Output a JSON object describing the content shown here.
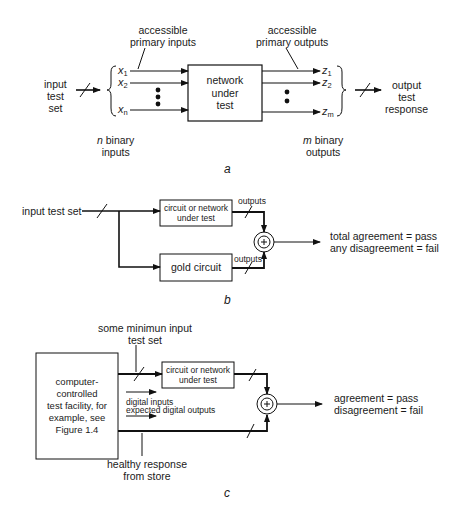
{
  "diagram_a": {
    "caption": "a",
    "input_label": [
      "input",
      "test",
      "set"
    ],
    "primary_inputs_label": [
      "accessible",
      "primary inputs"
    ],
    "primary_outputs_label": [
      "accessible",
      "primary outputs"
    ],
    "inputs": [
      {
        "name": "x",
        "sub": "1"
      },
      {
        "name": "x",
        "sub": "2"
      },
      {
        "name": "x",
        "sub": "n"
      }
    ],
    "outputs": [
      {
        "name": "z",
        "sub": "1"
      },
      {
        "name": "z",
        "sub": "2"
      },
      {
        "name": "z",
        "sub": "m"
      }
    ],
    "box_label": [
      "network",
      "under",
      "test"
    ],
    "n_binary_label": {
      "var": "n",
      "text": " binary",
      "line2": "inputs"
    },
    "m_binary_label": {
      "var": "m",
      "text": " binary",
      "line2": "outputs"
    },
    "output_label": [
      "output",
      "test",
      "response"
    ]
  },
  "diagram_b": {
    "caption": "b",
    "input_label": "input test set",
    "dut_box": [
      "circuit or network",
      "under test"
    ],
    "gold_box": "gold circuit",
    "outputs_label_top": "outputs",
    "outputs_label_bottom": "outputs",
    "comparator_symbol": "+",
    "result_lines": [
      "total agreement  = pass",
      "any disagreement  = fail"
    ]
  },
  "diagram_c": {
    "caption": "c",
    "min_input_label": [
      "some minimun input",
      "test set"
    ],
    "facility_box": [
      "computer-controlled",
      "test facility, for",
      "example, see",
      "Figure 1.4"
    ],
    "dut_box": [
      "circuit or network",
      "under test"
    ],
    "digital_inputs_label": "digital inputs",
    "expected_outputs_label": "expected digital outputs",
    "healthy_label": [
      "healthy response",
      "from store"
    ],
    "comparator_symbol": "+",
    "result_lines": [
      "agreement  = pass",
      "disagreement  = fail"
    ]
  }
}
